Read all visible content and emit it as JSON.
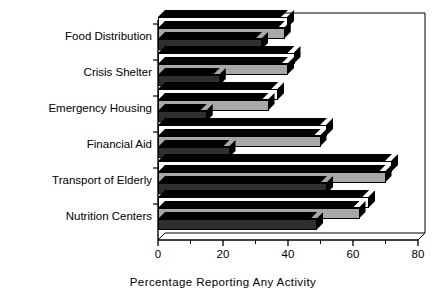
{
  "chart_data": {
    "type": "bar",
    "orientation": "horizontal",
    "title": "",
    "xlabel": "Percentage Reporting Any Activity",
    "ylabel": "",
    "xlim": [
      0,
      80
    ],
    "xticks": [
      0,
      20,
      40,
      60,
      80
    ],
    "xtick_labels": [
      "0",
      "20",
      "40",
      "60",
      "80"
    ],
    "minor_tick_step": 10,
    "grid": false,
    "legend": "none",
    "style": "3d-bars",
    "categories": [
      "Food Distribution",
      "Crisis Shelter",
      "Emergency Housing",
      "Financial Aid",
      "Transport of Elderly",
      "Nutrition Centers"
    ],
    "series": [
      {
        "name": "series-1",
        "color": "#fdfdfd",
        "values": [
          40,
          42,
          37,
          52,
          72,
          65
        ]
      },
      {
        "name": "series-2",
        "color": "#a8a8a8",
        "values": [
          39,
          40,
          34,
          50,
          70,
          62
        ]
      },
      {
        "name": "series-3",
        "color": "#2f2f2f",
        "values": [
          32,
          19,
          15,
          22,
          52,
          49
        ]
      }
    ]
  },
  "axis": {
    "title": "Percentage Reporting Any Activity"
  }
}
